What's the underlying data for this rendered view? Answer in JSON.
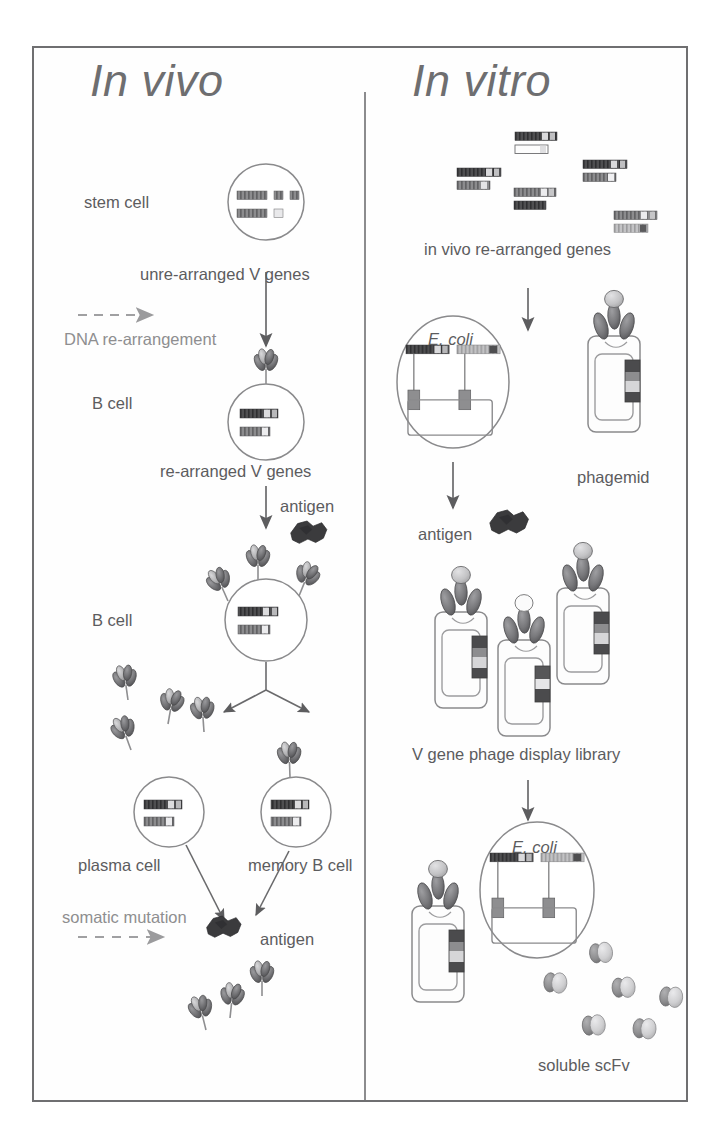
{
  "figure": {
    "type": "diagram",
    "background_color": "#ffffff",
    "frame_color": "#6f6f71",
    "text_color": "#5c5c5e",
    "faint_text_color": "#8e8e90"
  },
  "panels": {
    "left": {
      "title": "In vivo"
    },
    "right": {
      "title": "In vitro"
    }
  },
  "labels": {
    "stem_cell": "stem cell",
    "unrearranged": "unre-arranged V genes",
    "dna_rearrangement": "DNA re-arrangement",
    "b_cell_1": "B cell",
    "rearranged": "re-arranged V genes",
    "antigen_1": "antigen",
    "b_cell_2": "B cell",
    "plasma_cell": "plasma cell",
    "memory_b_cell": "memory B cell",
    "somatic_mutation": "somatic mutation",
    "antigen_2": "antigen",
    "invivo_rearranged_genes_italic": "in vivo",
    "invivo_rearranged_genes_rest": " re-arranged genes",
    "e_coli_top": "E. coli",
    "phagemid": "phagemid",
    "antigen_3": "antigen",
    "phage_library": "V gene phage display library",
    "e_coli_bottom": "E. coli",
    "soluble_scfv": "soluble scFv"
  },
  "colors": {
    "gene_dark": "#4b4b4d",
    "gene_mid": "#7a7a7c",
    "gene_light": "#c9c9cb",
    "gene_white": "#fdfdfd",
    "antibody_fill": "#6d6d70",
    "antibody_light": "#b4b4b6",
    "antigen_fill": "#3a3a3c",
    "phage_body": "#fbfbfb",
    "phage_outline": "#8a8a8c",
    "scfv_dark": "#8b8b8d",
    "scfv_light": "#d2d2d4",
    "arrow": "#6a6a6c",
    "dashed_arrow": "#a0a0a2",
    "cell_outline": "#8a8a8c"
  },
  "elements": {
    "stem_cell_genes": {
      "row1": [
        "long-striped-bar",
        "small-square",
        "small-square"
      ],
      "row2": [
        "long-striped-bar",
        "small-square"
      ]
    },
    "b_cell_genes": {
      "rows": 2,
      "style": "rearranged striped bars"
    },
    "invitro_gene_pairs": 5,
    "phage_library_particles": 3,
    "soluble_scfv_molecules": 6,
    "secreted_antibodies_plasma": 4,
    "secreted_antibodies_bottom": 3
  }
}
